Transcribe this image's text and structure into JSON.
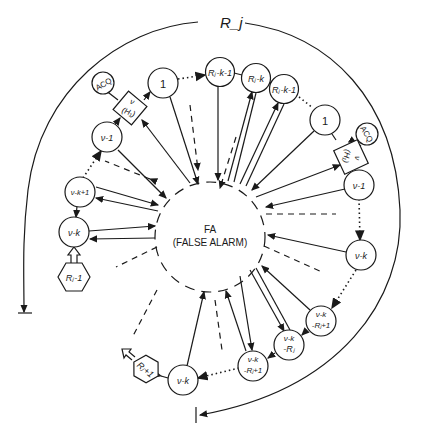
{
  "diagram": {
    "outer_arc_label": "R_j",
    "center_state": {
      "label_line1": "FA",
      "label_line2": "(FALSE ALARM)"
    },
    "nodes": {
      "acq_left": "ACQ",
      "h1_left_top": "ν",
      "h1_left_bottom": "(H₁)",
      "one_left": "1",
      "rj_k1_top": "Rⱼ-k-1",
      "rj_k": "Rⱼ-k",
      "rj_k1_right": "Rⱼ-k-1",
      "one_right": "1",
      "acq_right": "ACQ",
      "h1_right_top": "ν",
      "h1_right_bottom": "(H₁)",
      "nu1_right": "ν-1",
      "nuk_right": "ν-k",
      "nuk_rj1_right_top": "ν-k",
      "nuk_rj1_right_bottom": "-Rⱼ+1",
      "nuk_rj_top": "ν-k",
      "nuk_rj_bottom": "-Rⱼ",
      "nuk_rj1_bottom_top": "ν-k",
      "nuk_rj1_bottom_bottom": "-Rⱼ+1",
      "nuk_bottom": "ν-k",
      "rj_plus1": "Rⱼ+1",
      "nu1_left": "ν-1",
      "nuk1_left": "ν-k+1",
      "nuk_left": "ν-k",
      "rj_minus1": "Rⱼ-1"
    },
    "colors": {
      "ink": "#1a1a1a",
      "background": "#ffffff"
    }
  }
}
